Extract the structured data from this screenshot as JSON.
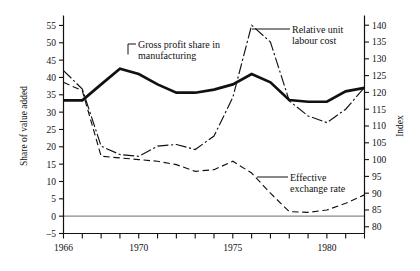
{
  "chart_data": {
    "type": "line",
    "title": "",
    "xlabel": "",
    "ylabel": "Share of value added",
    "y2label": "Index",
    "xlim": [
      1966,
      1982
    ],
    "ylim": [
      -5,
      57
    ],
    "y2lim": [
      78,
      142
    ],
    "grid": false,
    "legend": "annotations",
    "x_ticks": [
      1966,
      1967,
      1968,
      1969,
      1970,
      1971,
      1972,
      1973,
      1974,
      1975,
      1976,
      1977,
      1978,
      1979,
      1980,
      1981,
      1982
    ],
    "x_tick_labels": [
      "1966",
      "",
      "",
      "",
      "1970",
      "",
      "",
      "",
      "",
      "1975",
      "",
      "",
      "",
      "",
      "1980",
      "",
      ""
    ],
    "y_ticks": [
      -5,
      0,
      5,
      10,
      15,
      20,
      25,
      30,
      35,
      40,
      45,
      50,
      55
    ],
    "y_tick_labels": [
      "–5",
      "0",
      "5",
      "10",
      "15",
      "20",
      "25",
      "30",
      "35",
      "40",
      "45",
      "50",
      "55"
    ],
    "y2_ticks": [
      80,
      85,
      90,
      95,
      100,
      105,
      110,
      115,
      120,
      125,
      130,
      135,
      140
    ],
    "y2_tick_labels": [
      "80",
      "85",
      "90",
      "95",
      "100",
      "105",
      "110",
      "115",
      "120",
      "125",
      "130",
      "135",
      "140"
    ],
    "zero_line": 0,
    "series": [
      {
        "name": "Gross profit share in manufacturing",
        "axis": "left",
        "style": "thick-solid",
        "x": [
          1966,
          1967,
          1968,
          1969,
          1970,
          1971,
          1972,
          1973,
          1974,
          1975,
          1976,
          1977,
          1978,
          1979,
          1980,
          1981,
          1982
        ],
        "values": [
          33.4,
          33.4,
          38.0,
          42.5,
          41.0,
          38.0,
          35.6,
          35.6,
          36.5,
          38.0,
          41.0,
          38.6,
          33.5,
          33.0,
          33.0,
          36.0,
          37.0
        ],
        "annotation": {
          "label_line1": "Gross profit share in",
          "label_line2": "manufacturing"
        }
      },
      {
        "name": "Relative unit labour cost",
        "axis": "right",
        "style": "dash-dot",
        "x": [
          1966,
          1967,
          1968,
          1969,
          1970,
          1971,
          1972,
          1973,
          1974,
          1975,
          1976,
          1977,
          1978,
          1979,
          1980,
          1981,
          1982
        ],
        "values": [
          126.5,
          121.0,
          104.0,
          101.5,
          101.0,
          104.0,
          104.5,
          103.0,
          107.0,
          118.5,
          140.0,
          135.0,
          117.5,
          113.0,
          111.0,
          115.0,
          121.5
        ],
        "annotation": {
          "label_line1": "Relative unit",
          "label_line2": "labour cost"
        }
      },
      {
        "name": "Effective exchange rate",
        "axis": "right",
        "style": "dashed",
        "x": [
          1966,
          1967,
          1968,
          1969,
          1970,
          1971,
          1972,
          1973,
          1974,
          1975,
          1976,
          1977,
          1978,
          1979,
          1980,
          1981,
          1982
        ],
        "values": [
          123.0,
          120.5,
          101.0,
          100.5,
          100.0,
          99.5,
          98.5,
          96.5,
          97.0,
          99.5,
          96.0,
          90.0,
          84.5,
          84.3,
          85.0,
          87.0,
          89.5
        ],
        "annotation": {
          "label_line1": "Effective",
          "label_line2": "exchange rate"
        }
      }
    ]
  }
}
